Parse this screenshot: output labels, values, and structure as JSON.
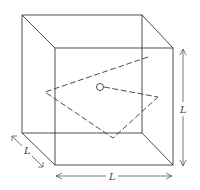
{
  "diagram": {
    "labels": {
      "depth": "L",
      "height": "L",
      "width": "L"
    },
    "colors": {
      "stroke": "#3a3a3a",
      "background": "#ffffff"
    }
  }
}
